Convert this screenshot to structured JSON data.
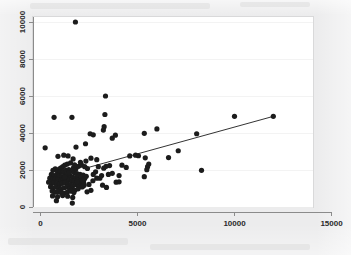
{
  "figure": {
    "background_color": "#ececed",
    "plot_background_color": "#ffffff",
    "axis_color": "#8b8b8b",
    "marker_color": "#1c1c1c",
    "line_color": "#1c1c1c",
    "grid_color": "#f0f0f0"
  },
  "chart_data": {
    "type": "scatter",
    "title": "",
    "subtitle": "",
    "xlabel": "",
    "ylabel": "",
    "xlim": [
      0,
      15000
    ],
    "ylim": [
      0,
      10400
    ],
    "grid": true,
    "legend": null,
    "legend_position": "none",
    "xticks": [
      0,
      5000,
      10000,
      15000
    ],
    "xticklabels": [
      "0",
      "5000",
      "10000",
      "15000"
    ],
    "yticks": [
      0,
      2000,
      4000,
      6000,
      8000,
      10000
    ],
    "yticklabels": [
      "0",
      "2000",
      "4000",
      "6000",
      "8000",
      "10000"
    ],
    "ytick_label_rotation": 90,
    "annotations": [],
    "series": [
      {
        "name": "observations",
        "type": "scatter",
        "marker": "filled-circle",
        "marker_size": 2.6,
        "color": "#1c1c1c",
        "points": [
          [
            240,
            3200
          ],
          [
            700,
            4850
          ],
          [
            1620,
            4850
          ],
          [
            1800,
            10000
          ],
          [
            3350,
            6000
          ],
          [
            3320,
            5000
          ],
          [
            3280,
            4340
          ],
          [
            3240,
            4160
          ],
          [
            2560,
            3960
          ],
          [
            2720,
            3900
          ],
          [
            3860,
            3880
          ],
          [
            3700,
            3720
          ],
          [
            5350,
            3980
          ],
          [
            6000,
            4220
          ],
          [
            8050,
            3960
          ],
          [
            10000,
            4900
          ],
          [
            12000,
            4900
          ],
          [
            2320,
            3420
          ],
          [
            1830,
            3240
          ],
          [
            7100,
            3040
          ],
          [
            6600,
            2670
          ],
          [
            4900,
            2800
          ],
          [
            4600,
            2760
          ],
          [
            1200,
            2800
          ],
          [
            1420,
            2760
          ],
          [
            900,
            2740
          ],
          [
            1680,
            2600
          ],
          [
            2600,
            2640
          ],
          [
            2900,
            2560
          ],
          [
            5050,
            2770
          ],
          [
            5400,
            2660
          ],
          [
            5580,
            2320
          ],
          [
            5520,
            2180
          ],
          [
            5480,
            2020
          ],
          [
            4420,
            2140
          ],
          [
            4200,
            2260
          ],
          [
            3560,
            2240
          ],
          [
            3380,
            2200
          ],
          [
            3260,
            2100
          ],
          [
            2980,
            2180
          ],
          [
            8300,
            1980
          ],
          [
            5350,
            1640
          ],
          [
            4050,
            1700
          ],
          [
            3700,
            1820
          ],
          [
            3500,
            1760
          ],
          [
            3150,
            1700
          ],
          [
            2900,
            1560
          ],
          [
            2700,
            1420
          ],
          [
            2500,
            1220
          ],
          [
            2250,
            1180
          ],
          [
            2080,
            1260
          ],
          [
            3200,
            1180
          ],
          [
            3400,
            1060
          ],
          [
            3900,
            1340
          ],
          [
            4050,
            1360
          ],
          [
            1550,
            2380
          ],
          [
            1380,
            2320
          ],
          [
            1250,
            2260
          ],
          [
            1150,
            2180
          ],
          [
            1060,
            2120
          ],
          [
            980,
            2060
          ],
          [
            1700,
            2120
          ],
          [
            1820,
            2060
          ],
          [
            1960,
            2200
          ],
          [
            2120,
            2260
          ],
          [
            2280,
            2180
          ],
          [
            2420,
            2080
          ],
          [
            760,
            2060
          ],
          [
            640,
            1980
          ],
          [
            880,
            1900
          ],
          [
            1020,
            1880
          ],
          [
            1180,
            1920
          ],
          [
            1320,
            1980
          ],
          [
            1460,
            2020
          ],
          [
            1600,
            1940
          ],
          [
            1740,
            1860
          ],
          [
            1880,
            1800
          ],
          [
            2040,
            1760
          ],
          [
            2200,
            1720
          ],
          [
            2360,
            1660
          ],
          [
            560,
            1760
          ],
          [
            700,
            1700
          ],
          [
            840,
            1740
          ],
          [
            960,
            1680
          ],
          [
            1100,
            1640
          ],
          [
            1240,
            1700
          ],
          [
            1380,
            1760
          ],
          [
            1520,
            1680
          ],
          [
            1660,
            1620
          ],
          [
            1800,
            1580
          ],
          [
            1940,
            1640
          ],
          [
            2100,
            1600
          ],
          [
            2280,
            1540
          ],
          [
            480,
            1560
          ],
          [
            620,
            1500
          ],
          [
            760,
            1540
          ],
          [
            900,
            1480
          ],
          [
            1040,
            1440
          ],
          [
            1180,
            1500
          ],
          [
            1320,
            1540
          ],
          [
            1460,
            1460
          ],
          [
            1600,
            1420
          ],
          [
            1740,
            1380
          ],
          [
            1900,
            1440
          ],
          [
            2060,
            1400
          ],
          [
            2220,
            1340
          ],
          [
            420,
            1340
          ],
          [
            560,
            1280
          ],
          [
            700,
            1320
          ],
          [
            840,
            1260
          ],
          [
            980,
            1220
          ],
          [
            1120,
            1280
          ],
          [
            1260,
            1320
          ],
          [
            1400,
            1240
          ],
          [
            1540,
            1200
          ],
          [
            1680,
            1160
          ],
          [
            1840,
            1220
          ],
          [
            2000,
            1180
          ],
          [
            2180,
            1120
          ],
          [
            520,
            1100
          ],
          [
            660,
            1040
          ],
          [
            800,
            1080
          ],
          [
            940,
            1020
          ],
          [
            1080,
            980
          ],
          [
            1220,
            1040
          ],
          [
            1360,
            1080
          ],
          [
            1500,
            1000
          ],
          [
            1640,
            960
          ],
          [
            1780,
            920
          ],
          [
            1940,
            980
          ],
          [
            2140,
            1080
          ],
          [
            600,
            860
          ],
          [
            740,
            800
          ],
          [
            900,
            840
          ],
          [
            1060,
            780
          ],
          [
            1220,
            740
          ],
          [
            1380,
            800
          ],
          [
            1560,
            860
          ],
          [
            1720,
            780
          ],
          [
            2400,
            820
          ],
          [
            2600,
            900
          ],
          [
            620,
            600
          ],
          [
            880,
            560
          ],
          [
            1140,
            620
          ],
          [
            1400,
            580
          ],
          [
            1660,
            520
          ],
          [
            820,
            340
          ],
          [
            1640,
            210
          ],
          [
            2720,
            1760
          ],
          [
            2840,
            1900
          ],
          [
            3060,
            1560
          ],
          [
            1240,
            1620
          ],
          [
            1480,
            1860
          ],
          [
            1760,
            2280
          ],
          [
            2060,
            2420
          ],
          [
            2340,
            2480
          ],
          [
            1900,
            1360
          ],
          [
            2180,
            1460
          ]
        ]
      },
      {
        "name": "fit-line",
        "type": "line",
        "color": "#1c1c1c",
        "x": [
          2300,
          12000
        ],
        "y": [
          2090,
          4900
        ]
      }
    ]
  }
}
